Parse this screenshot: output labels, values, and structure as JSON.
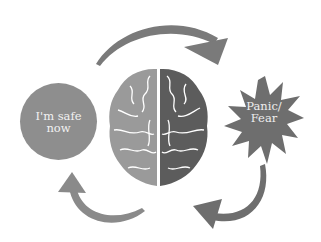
{
  "diagram": {
    "title": "",
    "nodes": [
      {
        "id": "safe",
        "label_line1": "I'm safe",
        "label_line2": "now",
        "shape": "circle"
      },
      {
        "id": "brain",
        "label": "",
        "shape": "brain-icon"
      },
      {
        "id": "panic",
        "label_line1": "Panic/",
        "label_line2": "Fear",
        "shape": "starburst"
      }
    ],
    "edges": [
      {
        "from": "safe",
        "to": "panic",
        "style": "curved-arrow-top"
      },
      {
        "from": "panic",
        "to": "brain",
        "style": "curved-arrow-bottom-right"
      },
      {
        "from": "brain",
        "to": "safe",
        "style": "curved-arrow-bottom-left"
      }
    ],
    "colors": {
      "circle": "#8e8e8e",
      "star": "#6e6e6e",
      "brain_left": "#9a9a9a",
      "brain_right": "#5c5c5c",
      "arrow": "#7a7a7a",
      "label_text": "#f2f2f2"
    }
  }
}
